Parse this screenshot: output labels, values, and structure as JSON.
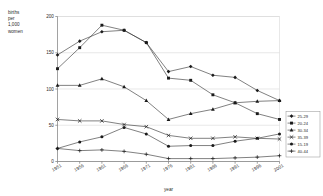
{
  "chart_data": {
    "type": "line",
    "title": "",
    "xlabel": "year",
    "ylabel": "births per 1,000 women",
    "ylabel_lines": [
      "births",
      "per",
      "1,000",
      "women"
    ],
    "x": [
      1951,
      1956,
      1961,
      1966,
      1971,
      1976,
      1981,
      1986,
      1991,
      1996,
      2001
    ],
    "xtick_labels": [
      "1951",
      "1956",
      "1961",
      "1966",
      "1971",
      "1976",
      "1981",
      "1986",
      "1991",
      "1996",
      "2001"
    ],
    "ytick_labels": [
      "0",
      "50",
      "100",
      "150",
      "200"
    ],
    "yticks": [
      0,
      50,
      100,
      150,
      200
    ],
    "ylim": [
      0,
      200
    ],
    "xlim": [
      1951,
      2001
    ],
    "grid": true,
    "legend_position": "right",
    "series": [
      {
        "name": "25-29",
        "marker": "diamond",
        "values": [
          147,
          166,
          179,
          181,
          164,
          124,
          131,
          119,
          116,
          98,
          84
        ]
      },
      {
        "name": "20-24",
        "marker": "square",
        "values": [
          128,
          157,
          188,
          181,
          164,
          115,
          112,
          92,
          81,
          66,
          58
        ]
      },
      {
        "name": "30-34",
        "marker": "triangle",
        "values": [
          105,
          105,
          114,
          103,
          84,
          58,
          66,
          72,
          81,
          83,
          84
        ]
      },
      {
        "name": "35-39",
        "marker": "cross",
        "values": [
          58,
          56,
          56,
          51,
          48,
          36,
          32,
          32,
          34,
          32,
          31
        ]
      },
      {
        "name": "15-19",
        "marker": "circle",
        "values": [
          18,
          27,
          34,
          47,
          38,
          21,
          22,
          22,
          28,
          32,
          38
        ]
      },
      {
        "name": "40-44",
        "marker": "plus",
        "values": [
          18,
          15,
          16,
          14,
          10,
          4,
          4,
          4,
          5,
          6,
          8
        ]
      }
    ]
  },
  "legend": {
    "items": [
      {
        "label": "25-29"
      },
      {
        "label": "20-24"
      },
      {
        "label": "30-34"
      },
      {
        "label": "35-39"
      },
      {
        "label": "15-19"
      },
      {
        "label": "40-44"
      }
    ]
  },
  "colors": {
    "line": "#333333",
    "grid": "#d8d8d8",
    "axis": "#7a7a7a",
    "text": "#2b2b2b",
    "background": "#ffffff"
  }
}
